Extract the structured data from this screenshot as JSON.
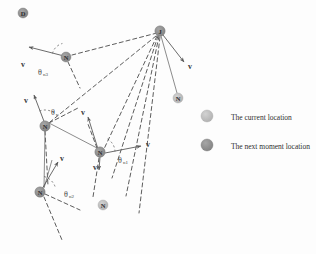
{
  "figure": {
    "title": "",
    "background_color": "#fdfdfd",
    "width": 316,
    "height": 254
  },
  "colors": {
    "current_node_fill": "#b9b9b9",
    "next_node_fill": "#8e8e8e",
    "dashed_line": "#4a4a4a",
    "solid_line": "#6e6e6e",
    "arrow": "#5a5a5a",
    "text": "#2b2b2b"
  },
  "nodes": [
    {
      "id": "n-top-left",
      "label": "D",
      "kind": "next",
      "cx": 23,
      "cy": 13,
      "r": 5.0
    },
    {
      "id": "n-hub",
      "label": "J",
      "kind": "next",
      "cx": 160,
      "cy": 31,
      "r": 5.2
    },
    {
      "id": "n-upper-left",
      "label": "N",
      "kind": "next",
      "cx": 66,
      "cy": 57,
      "r": 5.0
    },
    {
      "id": "n-mid-left",
      "label": "N",
      "kind": "next",
      "cx": 45,
      "cy": 126,
      "r": 5.2
    },
    {
      "id": "n-right-mid",
      "label": "N",
      "kind": "current",
      "cx": 178,
      "cy": 98,
      "r": 5.0
    },
    {
      "id": "n-lower-mid",
      "label": "N",
      "kind": "next",
      "cx": 100,
      "cy": 152,
      "r": 5.2
    },
    {
      "id": "n-bottom-left",
      "label": "N",
      "kind": "next",
      "cx": 40,
      "cy": 192,
      "r": 5.2
    },
    {
      "id": "n-bottom-mid",
      "label": "N",
      "kind": "current",
      "cx": 103,
      "cy": 205,
      "r": 5.0
    }
  ],
  "dashed_edges": [
    {
      "id": "hub-to-upper-left",
      "x1": 157,
      "y1": 33,
      "x2": 72,
      "y2": 55
    },
    {
      "id": "hub-to-mid-left",
      "x1": 156,
      "y1": 36,
      "x2": 50,
      "y2": 122
    },
    {
      "id": "hub-to-lower-mid",
      "x1": 157,
      "y1": 36,
      "x2": 104,
      "y2": 149
    },
    {
      "id": "hub-to-bottom-a",
      "x1": 158,
      "y1": 36,
      "x2": 112,
      "y2": 178
    },
    {
      "id": "hub-to-bottom-b",
      "x1": 159,
      "y1": 36,
      "x2": 126,
      "y2": 196
    },
    {
      "id": "hub-to-bottom-c",
      "x1": 160,
      "y1": 37,
      "x2": 139,
      "y2": 213
    },
    {
      "id": "upper-left-down",
      "x1": 68,
      "y1": 62,
      "x2": 80,
      "y2": 88
    },
    {
      "id": "mid-left-down",
      "x1": 45,
      "y1": 131,
      "x2": 48,
      "y2": 186
    },
    {
      "id": "bottom-left-down",
      "x1": 44,
      "y1": 197,
      "x2": 62,
      "y2": 240
    },
    {
      "id": "lower-mid-up",
      "x1": 97,
      "y1": 148,
      "x2": 88,
      "y2": 124
    },
    {
      "id": "lower-mid-down",
      "x1": 99,
      "y1": 158,
      "x2": 93,
      "y2": 197
    },
    {
      "id": "bottom-left-right",
      "x1": 45,
      "y1": 194,
      "x2": 80,
      "y2": 210
    },
    {
      "id": "mid-left-diag",
      "x1": 49,
      "y1": 123,
      "x2": 78,
      "y2": 108
    }
  ],
  "solid_edges": [
    {
      "id": "hub-to-right-mid",
      "x1": 161,
      "y1": 36,
      "x2": 177,
      "y2": 93
    },
    {
      "id": "mid-left-to-lower-mid",
      "x1": 49,
      "y1": 123,
      "x2": 97,
      "y2": 148
    },
    {
      "id": "lower-left-chain",
      "x1": 44,
      "y1": 188,
      "x2": 52,
      "y2": 160
    },
    {
      "id": "mid-left-chain",
      "x1": 45,
      "y1": 131,
      "x2": 44,
      "y2": 187
    }
  ],
  "velocity_arrows": [
    {
      "id": "v-upper-left",
      "label": "v",
      "x1": 64,
      "y1": 56,
      "x2": 29,
      "y2": 47,
      "label_x": 23,
      "label_y": 64
    },
    {
      "id": "v-mid-left",
      "label": "v",
      "x1": 45,
      "y1": 124,
      "x2": 34,
      "y2": 95,
      "label_x": 26,
      "label_y": 100
    },
    {
      "id": "v-hub",
      "label": "v",
      "x1": 163,
      "y1": 35,
      "x2": 184,
      "y2": 62,
      "label_x": 190,
      "label_y": 66
    },
    {
      "id": "v-lower-mid",
      "label": "v",
      "x1": 98,
      "y1": 149,
      "x2": 88,
      "y2": 117,
      "label_x": 83,
      "label_y": 112
    },
    {
      "id": "v-right-of-lower",
      "label": "v",
      "x1": 105,
      "y1": 153,
      "x2": 141,
      "y2": 146,
      "label_x": 148,
      "label_y": 144
    },
    {
      "id": "v-bottom-left",
      "label": "v",
      "x1": 42,
      "y1": 189,
      "x2": 58,
      "y2": 162,
      "label_x": 62,
      "label_y": 158
    },
    {
      "id": "v-lower-down",
      "label": "v",
      "x1": 100,
      "y1": 157,
      "x2": 99,
      "y2": 170,
      "label_x": 95,
      "label_y": 167
    }
  ],
  "angle_labels": [
    {
      "id": "theta-n3",
      "symbol": "θ",
      "subscript": "n3",
      "x": 38,
      "y": 72
    },
    {
      "id": "theta-c",
      "symbol": "θ",
      "subscript": "c",
      "x": 51,
      "y": 112
    },
    {
      "id": "theta-n2",
      "symbol": "θ",
      "subscript": "n2",
      "x": 64,
      "y": 194
    },
    {
      "id": "theta-n1",
      "symbol": "θ",
      "subscript": "n1",
      "x": 118,
      "y": 160
    }
  ],
  "angle_arcs": [
    {
      "id": "arc-n3",
      "cx": 66,
      "cy": 57,
      "r": 14,
      "start": 195,
      "end": 255
    },
    {
      "id": "arc-c",
      "cx": 45,
      "cy": 126,
      "r": 16,
      "start": 250,
      "end": 315
    },
    {
      "id": "arc-n2",
      "cx": 40,
      "cy": 192,
      "r": 16,
      "start": 285,
      "end": 345
    },
    {
      "id": "arc-n1",
      "cx": 100,
      "cy": 152,
      "r": 15,
      "start": 300,
      "end": 358
    }
  ],
  "legend": {
    "items": [
      {
        "id": "legend-current",
        "kind": "current",
        "label": "The current location",
        "cx": 207,
        "cy": 116,
        "r": 6.0,
        "text_x": 231,
        "text_y": 117
      },
      {
        "id": "legend-next",
        "kind": "next",
        "label": "The next moment location",
        "cx": 207,
        "cy": 145,
        "r": 6.0,
        "text_x": 231,
        "text_y": 146
      }
    ]
  }
}
